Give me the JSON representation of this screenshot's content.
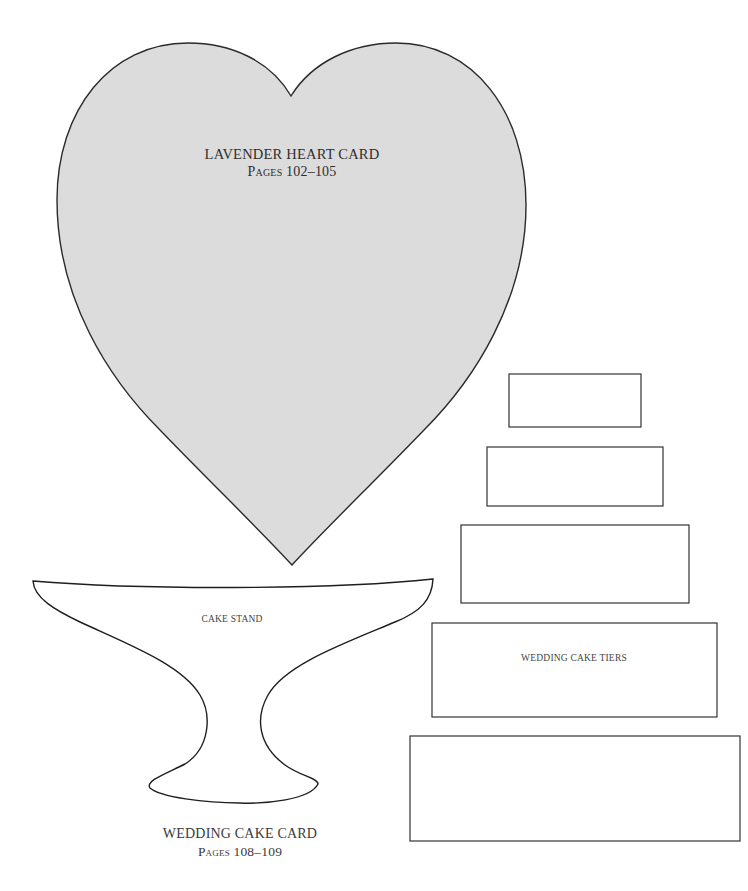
{
  "header": {
    "running_head_truncated": true
  },
  "colors": {
    "heart_fill": "#dcdcdc",
    "outline": "#2a2a2a",
    "shape_fill": "#ffffff",
    "background": "#ffffff"
  },
  "heart_card": {
    "title": "LAVENDER HEART CARD",
    "pages": "Pages 102–105"
  },
  "cake_stand": {
    "label": "CAKE STAND"
  },
  "cake_tiers": {
    "label": "WEDDING CAKE TIERS",
    "tiers": [
      {
        "x": 509,
        "y": 374,
        "w": 132,
        "h": 53
      },
      {
        "x": 487,
        "y": 447,
        "w": 176,
        "h": 59
      },
      {
        "x": 461,
        "y": 525,
        "w": 228,
        "h": 78
      },
      {
        "x": 432,
        "y": 623,
        "w": 285,
        "h": 94
      },
      {
        "x": 410,
        "y": 736,
        "w": 330,
        "h": 105
      }
    ]
  },
  "wedding_cake_card": {
    "title": "WEDDING CAKE CARD",
    "pages": "Pages 108–109"
  }
}
